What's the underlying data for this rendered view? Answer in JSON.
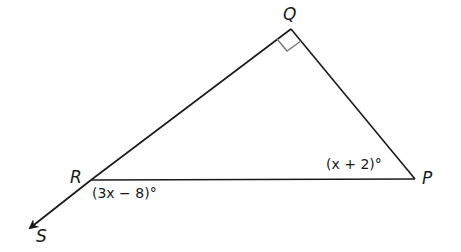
{
  "diagram": {
    "type": "triangle-with-exterior-angle",
    "vertices": {
      "Q": {
        "label": "Q",
        "x": 291,
        "y": 29
      },
      "R": {
        "label": "R",
        "x": 91,
        "y": 180
      },
      "P": {
        "label": "P",
        "x": 415,
        "y": 179
      },
      "S": {
        "label": "S",
        "x": 28,
        "y": 229
      }
    },
    "angles": {
      "Q": {
        "marker": "right-angle"
      },
      "P": {
        "expression": "(x + 2)°"
      },
      "SRP_exterior": {
        "expression": "(3x − 8)°"
      }
    },
    "ray": {
      "from": "R",
      "to": "S",
      "arrow": true
    },
    "colors": {
      "line": "#1a1a1a",
      "right_angle_marker": "#777777",
      "background": "#ffffff"
    }
  }
}
